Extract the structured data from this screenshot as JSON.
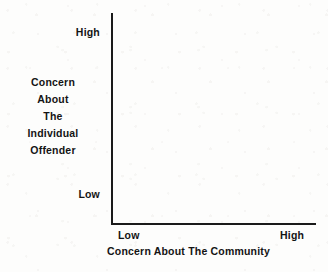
{
  "chart_data": {
    "type": "scatter",
    "title": "",
    "subtitle": "",
    "xlabel": "Concern About The Community",
    "ylabel": "Concern About The Individual Offender",
    "ylabel_lines": [
      "Concern",
      "About",
      "The",
      "Individual",
      "Offender"
    ],
    "x_tick_labels": [
      "Low",
      "High"
    ],
    "y_tick_labels": [
      "Low",
      "High"
    ],
    "xlim": [
      "Low",
      "High"
    ],
    "ylim": [
      "Low",
      "High"
    ],
    "series": [],
    "values": [],
    "annotations": [],
    "legend": [],
    "legend_position": "none",
    "grid": false,
    "colors": {
      "axis": "#1a1a1a",
      "text": "#141414",
      "background": "#fdfdfc"
    }
  },
  "axes": {
    "y": {
      "title_lines": [
        "Concern",
        "About",
        "The",
        "Individual",
        "Offender"
      ],
      "tick_high": "High",
      "tick_low": "Low"
    },
    "x": {
      "title": "Concern About The Community",
      "tick_low": "Low",
      "tick_high": "High"
    }
  }
}
